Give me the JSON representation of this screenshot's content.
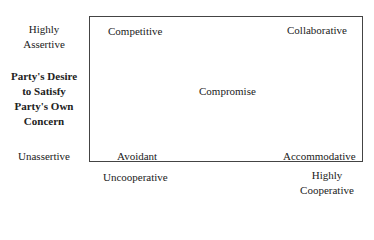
{
  "diagram": {
    "type": "conflict-modes-grid",
    "y_axis": {
      "top_label": [
        "Highly",
        "Assertive"
      ],
      "title": [
        "Party's Desire",
        "to Satisfy",
        "Party's Own",
        "Concern"
      ],
      "bottom_label": "Unassertive"
    },
    "x_axis": {
      "left_label": "Uncooperative",
      "right_label": [
        "Highly",
        "Cooperative"
      ]
    },
    "quadrants": {
      "top_left": "Competitive",
      "top_right": "Collaborative",
      "center": "Compromise",
      "bottom_left": "Avoidant",
      "bottom_right": "Accommodative"
    }
  }
}
